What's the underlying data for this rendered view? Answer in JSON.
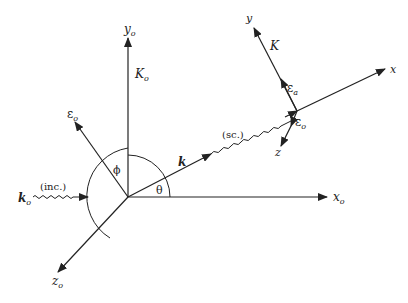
{
  "diagram": {
    "type": "scattering-geometry",
    "lab_frame": {
      "axes": [
        {
          "id": "x_o",
          "label": "x",
          "subscript": "o"
        },
        {
          "id": "y_o",
          "label": "y",
          "subscript": "o"
        },
        {
          "id": "z_o",
          "label": "z",
          "subscript": "o"
        }
      ],
      "vectors": [
        {
          "id": "K_o",
          "label": "K",
          "subscript": "o"
        },
        {
          "id": "eps_o_lab",
          "label": "ε",
          "subscript": "o"
        }
      ]
    },
    "incident": {
      "wave_vector": {
        "label": "k",
        "subscript": "o"
      },
      "tag": "(inc.)"
    },
    "scattered": {
      "wave_vector": {
        "label": "k"
      },
      "tag": "(sc.)"
    },
    "angles": [
      {
        "id": "theta",
        "label": "θ"
      },
      {
        "id": "phi",
        "label": "ϕ"
      }
    ],
    "scattered_frame": {
      "axes": [
        {
          "id": "x",
          "label": "x"
        },
        {
          "id": "y",
          "label": "y"
        },
        {
          "id": "z",
          "label": "z"
        }
      ],
      "vectors": [
        {
          "id": "K",
          "label": "K"
        },
        {
          "id": "eps_a",
          "label": "ε",
          "subscript": "a"
        },
        {
          "id": "eps_o_sc",
          "label": "ε",
          "subscript": "o"
        }
      ]
    }
  }
}
